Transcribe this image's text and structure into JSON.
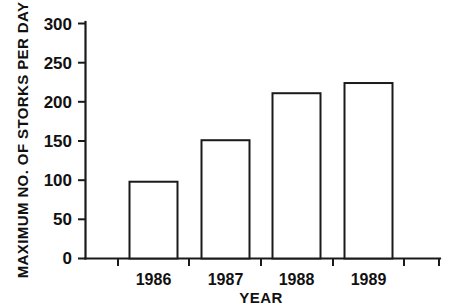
{
  "chart_data": {
    "type": "bar",
    "title": "",
    "subtitle": "",
    "categories": [
      "1986",
      "1987",
      "1988",
      "1989"
    ],
    "values": [
      98,
      151,
      211,
      224
    ],
    "xlabel": "YEAR",
    "ylabel": "MAXIMUM NO. OF STORKS PER DAY",
    "ylim": [
      0,
      300
    ],
    "yticks": [
      0,
      50,
      100,
      150,
      200,
      250,
      300
    ],
    "ytick_labels": [
      "0",
      "50",
      "100",
      "150",
      "200",
      "250",
      "300"
    ],
    "grid": false,
    "legend": false,
    "legend_position": "none",
    "series": [
      {
        "name": "Maximum no. of storks per day",
        "values": [
          98,
          151,
          211,
          224
        ]
      }
    ],
    "bar_style": {
      "fill": "#ffffff",
      "edge_color": "#1a1a1a"
    },
    "annotations": []
  },
  "axes": {
    "y_label": "MAXIMUM NO. OF STORKS PER DAY",
    "x_label": "YEAR",
    "y_ticks": [
      "300",
      "250",
      "200",
      "150",
      "100",
      "50",
      "0"
    ],
    "x_ticks": [
      "1986",
      "1987",
      "1988",
      "1989"
    ]
  }
}
